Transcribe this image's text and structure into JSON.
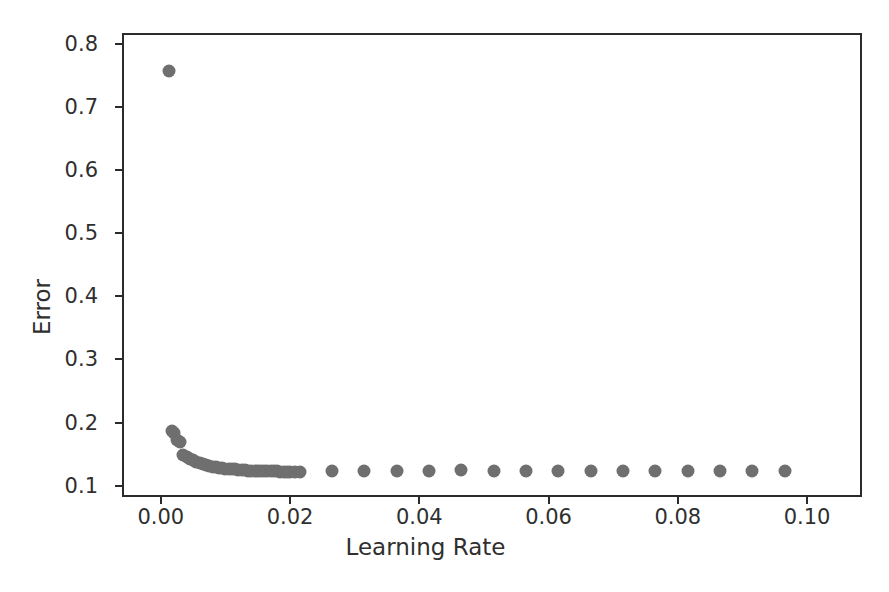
{
  "chart_data": {
    "type": "scatter",
    "title": "",
    "xlabel": "Learning Rate",
    "ylabel": "Error",
    "xlim": [
      -0.006,
      0.1085
    ],
    "ylim": [
      0.082,
      0.817
    ],
    "xticks": [
      "0.00",
      "0.02",
      "0.04",
      "0.06",
      "0.08",
      "0.10"
    ],
    "xtick_values": [
      0.0,
      0.02,
      0.04,
      0.06,
      0.08,
      0.1
    ],
    "yticks": [
      "0.1",
      "0.2",
      "0.3",
      "0.4",
      "0.5",
      "0.6",
      "0.7",
      "0.8"
    ],
    "ytick_values": [
      0.1,
      0.2,
      0.3,
      0.4,
      0.5,
      0.6,
      0.7,
      0.8
    ],
    "grid": false,
    "legend": null,
    "marker": "circle",
    "marker_color": "#6f6f6f",
    "marker_size": 13,
    "series": [
      {
        "name": "Error vs Learning Rate",
        "points": [
          [
            0.001,
            0.76
          ],
          [
            0.0015,
            0.19
          ],
          [
            0.0018,
            0.186
          ],
          [
            0.0022,
            0.175
          ],
          [
            0.0026,
            0.172
          ],
          [
            0.0032,
            0.152
          ],
          [
            0.0037,
            0.148
          ],
          [
            0.0042,
            0.145
          ],
          [
            0.0047,
            0.143
          ],
          [
            0.0052,
            0.141
          ],
          [
            0.0057,
            0.139
          ],
          [
            0.0062,
            0.137
          ],
          [
            0.0067,
            0.136
          ],
          [
            0.0072,
            0.134
          ],
          [
            0.0077,
            0.133
          ],
          [
            0.0082,
            0.132
          ],
          [
            0.0087,
            0.131
          ],
          [
            0.0092,
            0.131
          ],
          [
            0.0097,
            0.13
          ],
          [
            0.0102,
            0.13
          ],
          [
            0.0107,
            0.129
          ],
          [
            0.0112,
            0.129
          ],
          [
            0.0117,
            0.128
          ],
          [
            0.0122,
            0.128
          ],
          [
            0.0127,
            0.128
          ],
          [
            0.0132,
            0.127
          ],
          [
            0.0137,
            0.127
          ],
          [
            0.0142,
            0.127
          ],
          [
            0.0147,
            0.127
          ],
          [
            0.0152,
            0.126
          ],
          [
            0.0157,
            0.126
          ],
          [
            0.0162,
            0.126
          ],
          [
            0.0167,
            0.126
          ],
          [
            0.0172,
            0.126
          ],
          [
            0.0177,
            0.126
          ],
          [
            0.0182,
            0.125
          ],
          [
            0.0187,
            0.125
          ],
          [
            0.0192,
            0.125
          ],
          [
            0.0197,
            0.125
          ],
          [
            0.0205,
            0.125
          ],
          [
            0.0212,
            0.125
          ],
          [
            0.0262,
            0.127
          ],
          [
            0.0312,
            0.126
          ],
          [
            0.0362,
            0.126
          ],
          [
            0.0412,
            0.127
          ],
          [
            0.0462,
            0.128
          ],
          [
            0.0512,
            0.126
          ],
          [
            0.0562,
            0.126
          ],
          [
            0.0612,
            0.127
          ],
          [
            0.0662,
            0.127
          ],
          [
            0.0712,
            0.126
          ],
          [
            0.0762,
            0.126
          ],
          [
            0.0812,
            0.127
          ],
          [
            0.0862,
            0.126
          ],
          [
            0.0912,
            0.126
          ],
          [
            0.0962,
            0.126
          ]
        ]
      }
    ]
  }
}
